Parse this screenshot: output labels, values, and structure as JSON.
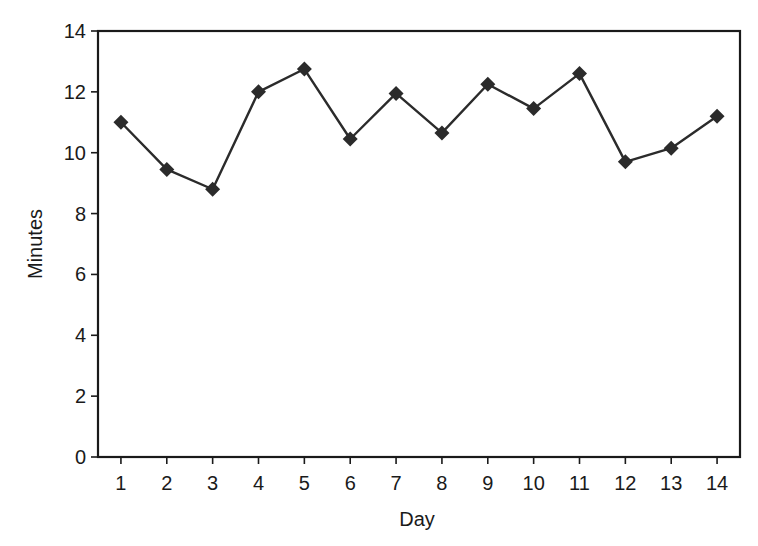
{
  "chart_data": {
    "type": "line",
    "title": "",
    "xlabel": "Day",
    "ylabel": "Minutes",
    "categories": [
      "1",
      "2",
      "3",
      "4",
      "5",
      "6",
      "7",
      "8",
      "9",
      "10",
      "11",
      "12",
      "13",
      "14"
    ],
    "x": [
      1,
      2,
      3,
      4,
      5,
      6,
      7,
      8,
      9,
      10,
      11,
      12,
      13,
      14
    ],
    "series": [
      {
        "name": "Minutes",
        "marker": "diamond",
        "color": "#2b2b2b",
        "values": [
          11.0,
          9.45,
          8.8,
          12.0,
          12.75,
          10.45,
          11.95,
          10.65,
          12.25,
          11.45,
          12.6,
          9.7,
          10.15,
          11.2
        ]
      }
    ],
    "ylim": [
      0,
      14
    ],
    "xlim": [
      0.5,
      14.5
    ],
    "yticks": [
      0,
      2,
      4,
      6,
      8,
      10,
      12,
      14
    ],
    "grid": false,
    "legend": null
  },
  "colors": {
    "axis": "#1a1a1a",
    "line": "#2b2b2b",
    "marker": "#2b2b2b",
    "background": "#ffffff"
  }
}
